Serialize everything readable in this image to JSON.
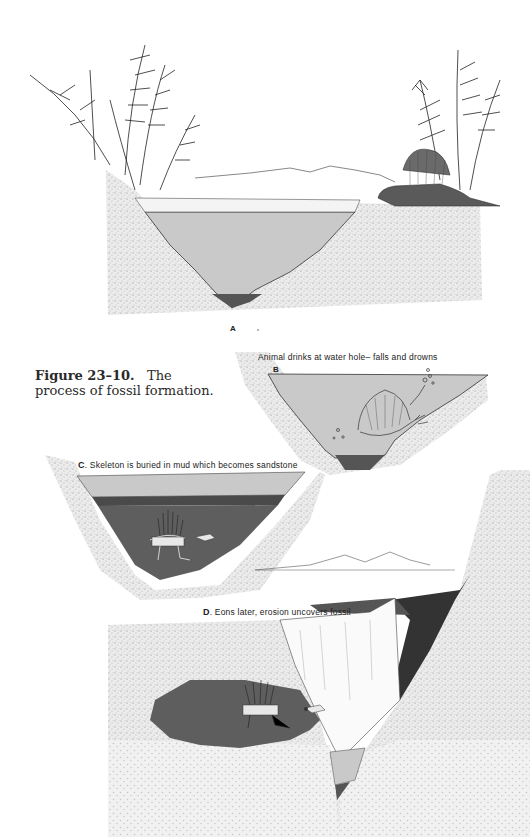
{
  "figure": {
    "number": "Figure 23–10.",
    "title": "The process of fossil formation."
  },
  "panels": [
    {
      "letter": "A",
      "caption": ""
    },
    {
      "letter": "B",
      "caption": "Animal drinks at water hole– falls and drowns"
    },
    {
      "letter": "C",
      "caption": "Skeleton is buried in mud which becomes sandstone"
    },
    {
      "letter": "D",
      "caption": "Eons later, erosion uncovers fossil"
    }
  ],
  "colors": {
    "water": "#c9c9c9",
    "water_light": "#d8d8d8",
    "mud": "#5e5e5e",
    "mud_dark": "#4a4a4a",
    "sand": "#e6e6e6",
    "sand_stipple": "#9a9a9a",
    "ink": "#222222",
    "background": "#ffffff"
  }
}
